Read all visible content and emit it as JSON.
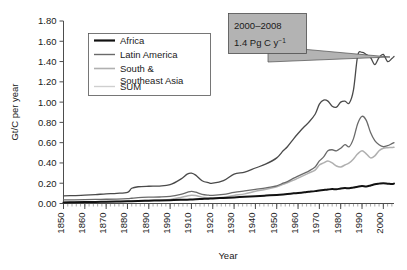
{
  "chart_data": {
    "type": "line",
    "title": "",
    "xlabel": "Year",
    "ylabel": "Gt/C per year",
    "xlim": [
      1850,
      2005
    ],
    "ylim": [
      0.0,
      1.8
    ],
    "grid": false,
    "legend_position": "top-left",
    "y_ticks": [
      "0.00",
      "0.20",
      "0.40",
      "0.60",
      "0.80",
      "1.00",
      "1.20",
      "1.40",
      "1.60",
      "1.80"
    ],
    "y_tick_values": [
      0.0,
      0.2,
      0.4,
      0.6,
      0.8,
      1.0,
      1.2,
      1.4,
      1.6,
      1.8
    ],
    "x_ticks": [
      "1850",
      "1860",
      "1870",
      "1880",
      "1890",
      "1990",
      "1910",
      "1920",
      "1930",
      "1940",
      "1950",
      "1960",
      "1970",
      "1980",
      "1990",
      "2000"
    ],
    "x_tick_values": [
      1850,
      1860,
      1870,
      1880,
      1890,
      1900,
      1910,
      1920,
      1930,
      1940,
      1950,
      1960,
      1970,
      1980,
      1990,
      2000
    ],
    "minor_tick_interval": 2,
    "annotations": [
      {
        "name": "sum-peak-callout",
        "line1": "2000–2008",
        "line2_text": "1.4 Pg C y",
        "line2_sup": "−1",
        "points_to_year": 2000,
        "points_to_value": 1.45
      }
    ],
    "x": [
      1850,
      1855,
      1860,
      1865,
      1870,
      1875,
      1880,
      1882,
      1885,
      1890,
      1895,
      1900,
      1905,
      1908,
      1910,
      1912,
      1915,
      1918,
      1920,
      1925,
      1930,
      1935,
      1940,
      1945,
      1950,
      1953,
      1955,
      1958,
      1960,
      1963,
      1965,
      1968,
      1970,
      1972,
      1974,
      1976,
      1978,
      1980,
      1982,
      1984,
      1986,
      1988,
      1990,
      1992,
      1994,
      1996,
      1998,
      2000,
      2002,
      2004,
      2005
    ],
    "series": [
      {
        "name": "Africa",
        "color": "#111111",
        "width": 2.0,
        "values": [
          0.01,
          0.012,
          0.014,
          0.016,
          0.018,
          0.02,
          0.022,
          0.023,
          0.025,
          0.028,
          0.03,
          0.033,
          0.036,
          0.038,
          0.04,
          0.042,
          0.045,
          0.048,
          0.05,
          0.055,
          0.06,
          0.066,
          0.072,
          0.078,
          0.085,
          0.09,
          0.094,
          0.1,
          0.104,
          0.11,
          0.115,
          0.122,
          0.128,
          0.133,
          0.138,
          0.142,
          0.14,
          0.148,
          0.152,
          0.15,
          0.158,
          0.166,
          0.172,
          0.168,
          0.178,
          0.19,
          0.196,
          0.2,
          0.196,
          0.192,
          0.196
        ]
      },
      {
        "name": "Latin America",
        "color": "#6a6a6a",
        "width": 1.3,
        "values": [
          0.035,
          0.036,
          0.038,
          0.04,
          0.042,
          0.044,
          0.048,
          0.052,
          0.058,
          0.062,
          0.064,
          0.07,
          0.09,
          0.11,
          0.12,
          0.112,
          0.09,
          0.082,
          0.08,
          0.09,
          0.11,
          0.125,
          0.14,
          0.155,
          0.175,
          0.2,
          0.215,
          0.25,
          0.27,
          0.3,
          0.32,
          0.36,
          0.42,
          0.46,
          0.52,
          0.53,
          0.52,
          0.545,
          0.58,
          0.56,
          0.64,
          0.79,
          0.86,
          0.82,
          0.7,
          0.62,
          0.58,
          0.56,
          0.57,
          0.59,
          0.6
        ]
      },
      {
        "name": "South & Southeast Asia",
        "color": "#b0b0b0",
        "width": 1.5,
        "values": [
          0.012,
          0.013,
          0.014,
          0.016,
          0.018,
          0.02,
          0.022,
          0.024,
          0.027,
          0.03,
          0.034,
          0.04,
          0.06,
          0.075,
          0.082,
          0.078,
          0.062,
          0.056,
          0.055,
          0.062,
          0.08,
          0.095,
          0.12,
          0.14,
          0.165,
          0.19,
          0.205,
          0.23,
          0.25,
          0.28,
          0.3,
          0.33,
          0.38,
          0.4,
          0.42,
          0.4,
          0.37,
          0.36,
          0.38,
          0.4,
          0.44,
          0.49,
          0.52,
          0.49,
          0.45,
          0.47,
          0.52,
          0.545,
          0.55,
          0.552,
          0.555
        ]
      },
      {
        "name": "SUM",
        "color": "#4a4a4a",
        "width": 1.3,
        "values": [
          0.075,
          0.078,
          0.082,
          0.088,
          0.095,
          0.1,
          0.11,
          0.15,
          0.165,
          0.17,
          0.172,
          0.185,
          0.24,
          0.29,
          0.3,
          0.28,
          0.225,
          0.205,
          0.2,
          0.225,
          0.29,
          0.31,
          0.35,
          0.39,
          0.45,
          0.52,
          0.56,
          0.64,
          0.69,
          0.76,
          0.8,
          0.88,
          0.98,
          1.02,
          1.01,
          0.96,
          0.95,
          1.0,
          1.01,
          0.99,
          1.12,
          1.46,
          1.49,
          1.47,
          1.44,
          1.37,
          1.44,
          1.47,
          1.4,
          1.43,
          1.45
        ]
      }
    ],
    "legend_entries": [
      {
        "label": "Africa",
        "color": "#111111",
        "width": 2.2
      },
      {
        "label": "Latin America",
        "color": "#6a6a6a",
        "width": 1.4
      },
      {
        "label": "South &",
        "label2": "Southeast Asia",
        "color": "#b0b0b0",
        "width": 1.6
      },
      {
        "label": "SUM",
        "color": "#cfcfcf",
        "width": 1.4
      }
    ]
  }
}
